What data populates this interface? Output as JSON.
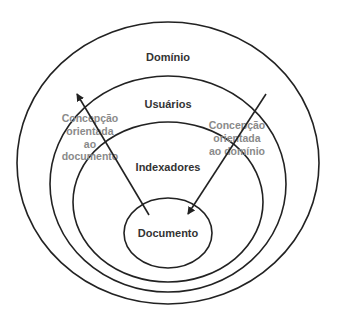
{
  "diagram": {
    "type": "nested-ellipses",
    "colors": {
      "stroke": "#222222",
      "label": "#333333",
      "annotation": "#8a8a8a",
      "background": "#ffffff"
    },
    "layers": [
      {
        "id": "dominio",
        "label": "Domínio"
      },
      {
        "id": "usuarios",
        "label": "Usuários"
      },
      {
        "id": "indexadores",
        "label": "Indexadores"
      },
      {
        "id": "documento",
        "label": "Documento"
      }
    ],
    "arrows": [
      {
        "id": "doc-oriented",
        "direction": "outward",
        "lines": [
          "Concepção",
          "orientada",
          "ao",
          "documento"
        ]
      },
      {
        "id": "domain-oriented",
        "direction": "inward",
        "lines": [
          "Concepção",
          "orientada",
          "ao domínio"
        ]
      }
    ]
  }
}
